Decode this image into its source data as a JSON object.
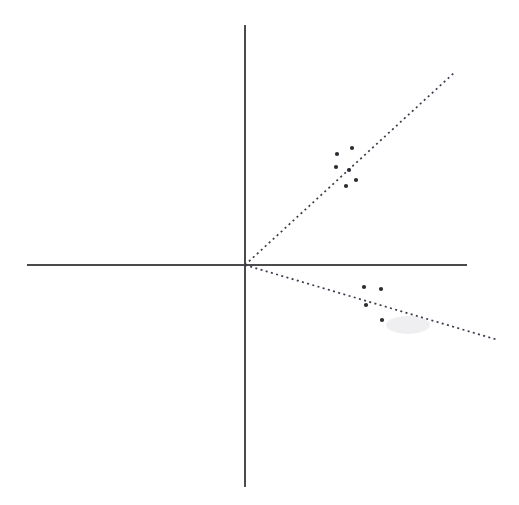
{
  "chart_data": {
    "type": "scatter",
    "title": "",
    "subtitle": "",
    "xlabel": "",
    "ylabel": "",
    "grid": false,
    "legend": "none",
    "axis_style": "cartesian-cross",
    "origin_px": [
      244,
      265
    ],
    "xlim_px": [
      27,
      467
    ],
    "ylim_px": [
      25,
      487
    ],
    "axes": {
      "horizontal": {
        "name": "x-axis",
        "x1": 27,
        "y1": 265,
        "x2": 467,
        "y2": 265,
        "color": "#4a4a4a"
      },
      "vertical": {
        "name": "y-axis",
        "x1": 245,
        "y1": 25,
        "x2": 245,
        "y2": 487,
        "color": "#4a4a4a"
      }
    },
    "series": [
      {
        "name": "positive-correlation-cluster",
        "quadrant": "upper-right",
        "marker": "filled-square-dot",
        "color": "#2b2b33",
        "points_px": [
          [
            337,
            154
          ],
          [
            352,
            148
          ],
          [
            336,
            167
          ],
          [
            349,
            170
          ],
          [
            356,
            180
          ],
          [
            346,
            186
          ]
        ],
        "points_data": [
          [
            93,
            111
          ],
          [
            108,
            117
          ],
          [
            92,
            98
          ],
          [
            105,
            95
          ],
          [
            112,
            85
          ],
          [
            102,
            79
          ]
        ]
      },
      {
        "name": "negative-correlation-cluster",
        "quadrant": "lower-right",
        "marker": "filled-square-dot",
        "color": "#2b2b33",
        "points_px": [
          [
            364,
            287
          ],
          [
            381,
            289
          ],
          [
            366,
            305
          ],
          [
            382,
            320
          ]
        ],
        "points_data": [
          [
            120,
            -22
          ],
          [
            137,
            -24
          ],
          [
            122,
            -40
          ],
          [
            138,
            -55
          ]
        ]
      }
    ],
    "trend_lines": [
      {
        "name": "positive-trend-line",
        "style": "dotted",
        "color": "#3a3a4a",
        "from_px": [
          245,
          265
        ],
        "to_px": [
          455,
          72
        ],
        "slope": 0.919,
        "intercept": 0,
        "direction": "upward"
      },
      {
        "name": "negative-trend-line",
        "style": "dotted",
        "color": "#3a3a4a",
        "from_px": [
          245,
          265
        ],
        "to_px": [
          498,
          340
        ],
        "slope": -0.296,
        "intercept": 0,
        "direction": "downward"
      }
    ],
    "annotations": [],
    "tick_labels": {
      "x": [],
      "y": []
    }
  },
  "figure": {
    "width": 519,
    "height": 505,
    "background": "#ffffff",
    "marker_radius_px": 2.1,
    "artifact": {
      "name": "paper-smudge",
      "cx": 408,
      "cy": 325,
      "rx": 22,
      "ry": 9
    }
  }
}
